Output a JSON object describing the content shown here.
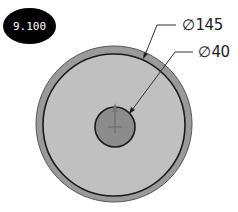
{
  "badge": {
    "label": "9.100"
  },
  "dimensions": [
    {
      "symbol": "∅",
      "value": "145"
    },
    {
      "symbol": "∅",
      "value": "40"
    }
  ],
  "colors": {
    "outer_ring": "#9a9a9a",
    "face": "#bfbfbf",
    "hub": "#8c8c8c",
    "outline": "#1a1a1a"
  }
}
